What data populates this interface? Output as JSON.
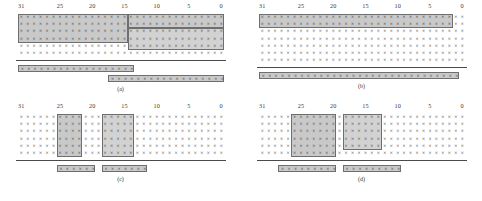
{
  "figure": {
    "columns": 32,
    "cell_glyph": "×",
    "tick_labels": [
      "31",
      "25",
      "20",
      "15",
      "10",
      "5",
      "0"
    ],
    "tick_bits": [
      31,
      25,
      20,
      15,
      10,
      5,
      0
    ],
    "colors": {
      "shade_fill": "#c9c9c9",
      "shade_fill_light": "#d2d2d2",
      "shade_border": "#6e6e6e",
      "rule": "#4a4a4a",
      "glyph": "#2b2b2b",
      "tick_text": "#3a3a3a",
      "background": "#ffffff"
    }
  },
  "panels": [
    {
      "id": "a",
      "caption": "(a)",
      "grid_rows": 6,
      "shades": [
        {
          "name": "shade-top-wide",
          "row_start": 0,
          "row_end": 3,
          "bit_high": 31,
          "bit_low": 15,
          "tone": "normal"
        },
        {
          "name": "shade-top-right",
          "row_start": 0,
          "row_end": 1,
          "bit_high": 14,
          "bit_low": 0,
          "tone": "normal"
        },
        {
          "name": "shade-mid-right",
          "row_start": 2,
          "row_end": 4,
          "bit_high": 14,
          "bit_low": 0,
          "tone": "light"
        }
      ],
      "bars": [
        {
          "name": "operand-bar-upper",
          "bit_high": 31,
          "bit_low": 14,
          "row": 0
        },
        {
          "name": "operand-bar-lower",
          "bit_high": 17,
          "bit_low": 0,
          "row": 1
        }
      ]
    },
    {
      "id": "b",
      "caption": "(b)",
      "grid_rows": 7,
      "shades": [
        {
          "name": "shade-top-band",
          "row_start": 0,
          "row_end": 1,
          "bit_high": 31,
          "bit_low": 2,
          "tone": "normal"
        }
      ],
      "bars": [
        {
          "name": "operand-bar-full",
          "bit_high": 31,
          "bit_low": 1,
          "row": 0
        }
      ]
    },
    {
      "id": "c",
      "caption": "(c)",
      "grid_rows": 6,
      "shades": [
        {
          "name": "shade-block-left",
          "row_start": 0,
          "row_end": 5,
          "bit_high": 25,
          "bit_low": 22,
          "tone": "normal"
        },
        {
          "name": "shade-block-right",
          "row_start": 0,
          "row_end": 5,
          "bit_high": 18,
          "bit_low": 14,
          "tone": "light"
        }
      ],
      "bars": [
        {
          "name": "operand-bar-left",
          "bit_high": 25,
          "bit_low": 20,
          "row": 0
        },
        {
          "name": "operand-bar-right",
          "bit_high": 18,
          "bit_low": 12,
          "row": 0
        }
      ]
    },
    {
      "id": "d",
      "caption": "(d)",
      "grid_rows": 6,
      "shades": [
        {
          "name": "shade-block-left",
          "row_start": 0,
          "row_end": 5,
          "bit_high": 26,
          "bit_low": 20,
          "tone": "normal"
        },
        {
          "name": "shade-block-right",
          "row_start": 0,
          "row_end": 4,
          "bit_high": 18,
          "bit_low": 13,
          "tone": "light"
        }
      ],
      "bars": [
        {
          "name": "operand-bar-left",
          "bit_high": 28,
          "bit_low": 20,
          "row": 0
        },
        {
          "name": "operand-bar-right",
          "bit_high": 18,
          "bit_low": 10,
          "row": 0
        }
      ]
    }
  ],
  "layout": {
    "panel_positions": [
      {
        "id": "a",
        "left": 0,
        "top": 0
      },
      {
        "id": "b",
        "left": 241,
        "top": 0
      },
      {
        "id": "c",
        "left": 0,
        "top": 100
      },
      {
        "id": "d",
        "left": 241,
        "top": 100
      }
    ],
    "grid_left": 18,
    "grid_top": 14,
    "cell_w": 6.45,
    "cell_h": 7.2,
    "rule_pad": 3,
    "bar_gap": 4.5,
    "bar_h": 7.6
  }
}
